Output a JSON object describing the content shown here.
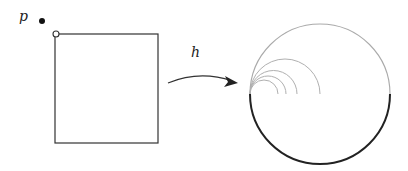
{
  "diagram": {
    "type": "mapping-illustration",
    "labels": {
      "point": "p",
      "map": "h"
    },
    "square": {
      "x": 55,
      "y": 34,
      "width": 103,
      "height": 109,
      "stroke": "#333333"
    },
    "corner_marker": {
      "cx": 56,
      "cy": 34,
      "r": 3,
      "fill": "#ffffff",
      "stroke": "#333333"
    },
    "point_marker": {
      "cx": 42,
      "cy": 21,
      "r": 3,
      "fill": "#111111"
    },
    "arrow": {
      "from": [
        168,
        83
      ],
      "to": [
        238,
        82
      ],
      "color": "#333333"
    },
    "disk": {
      "cx": 320,
      "cy": 94,
      "r": 70,
      "upper_stroke": "#aaaaaa",
      "lower_stroke": "#222222"
    },
    "inner_arcs": {
      "stroke": "#b0b0b0",
      "base_x": 250,
      "base_y": 94,
      "end_xs": [
        278,
        286,
        297,
        320
      ]
    }
  }
}
